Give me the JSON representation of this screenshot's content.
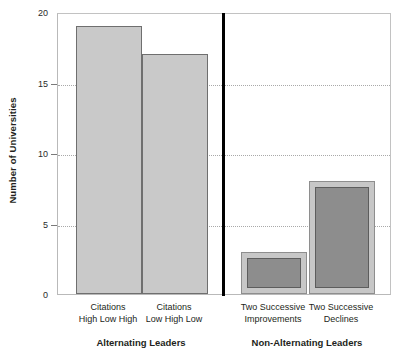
{
  "chart_data": {
    "type": "bar",
    "title": "",
    "xlabel": "",
    "ylabel": "Number of Universities",
    "ylim": [
      0,
      20
    ],
    "yticks": [
      0,
      5,
      10,
      15,
      20
    ],
    "ytick_labels": [
      "0",
      "5",
      "10",
      "15",
      "20"
    ],
    "grid": "horizontal-dotted",
    "legend": "none",
    "categories": [
      "Citations High Low High",
      "Citations Low High Low",
      "Two Successive Improvements",
      "Two Successive Declines"
    ],
    "values": [
      19,
      17,
      3,
      8
    ],
    "groups": [
      {
        "label": "Alternating Leaders",
        "categories": [
          0,
          1
        ]
      },
      {
        "label": "Non-Alternating Leaders",
        "categories": [
          2,
          3
        ]
      }
    ],
    "bars": [
      {
        "category": "Citations High Low High",
        "line1": "Citations",
        "line2": "High Low High",
        "value": 19,
        "style": "plain",
        "fill": "#c9c9c9",
        "stroke": "#6f6f6f"
      },
      {
        "category": "Citations Low High Low",
        "line1": "Citations",
        "line2": "Low High Low",
        "value": 17,
        "style": "plain",
        "fill": "#c9c9c9",
        "stroke": "#6f6f6f"
      },
      {
        "category": "Two Successive Improvements",
        "line1": "Two Successive",
        "line2": "Improvements",
        "value": 3,
        "style": "framed",
        "fill": "#8d8d8d",
        "frame": "#c7c7c7",
        "stroke": "#5d5d5d"
      },
      {
        "category": "Two Successive Declines",
        "line1": "Two Successive",
        "line2": "Declines",
        "value": 8,
        "style": "framed",
        "fill": "#8d8d8d",
        "frame": "#c7c7c7",
        "stroke": "#5d5d5d"
      }
    ],
    "divider": {
      "between": [
        "Alternating Leaders",
        "Non-Alternating Leaders"
      ],
      "color": "#000000"
    },
    "colors": {
      "background": "#ffffff",
      "axis": "#b9b9b9",
      "gridline": "#a9a9a9",
      "text": "#231f20",
      "bar_light": "#c9c9c9",
      "bar_dark": "#8d8d8d"
    }
  }
}
